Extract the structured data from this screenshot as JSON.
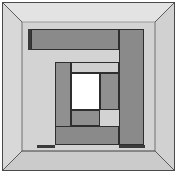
{
  "figure": {
    "type": "line-drawing",
    "canvas": {
      "width": 179,
      "height": 175
    },
    "palette": {
      "page_background": "#ffffff",
      "frame_outline": "#4a4a4a",
      "wall_light": "#dcdcdc",
      "wall_back": "#d2d2d2",
      "ceiling": "#e2e2e2",
      "floor": "#cccccc",
      "side_wall_left": "#d6d6d6",
      "side_wall_right": "#d0d0d0",
      "block_dark": "#8a8a8a",
      "block_mid": "#909090",
      "block_light": "#cfcfcf",
      "block_white": "#ffffff",
      "block_outline": "#2e2e2e",
      "shadow": "#3a3a3a"
    },
    "outer_frame": {
      "x": 2,
      "y": 2,
      "width": 173,
      "height": 169
    },
    "vanishing_box": {
      "outer": {
        "x": 3,
        "y": 3,
        "width": 171,
        "height": 167
      },
      "inner": {
        "x": 22,
        "y": 22,
        "width": 133,
        "height": 129
      },
      "diagonals": [
        {
          "name": "top-left-diagonal",
          "x1": 3,
          "y1": 3,
          "x2": 22,
          "y2": 22
        },
        {
          "name": "top-right-diagonal",
          "x1": 174,
          "y1": 3,
          "x2": 155,
          "y2": 22
        },
        {
          "name": "bottom-left-diagonal",
          "x1": 3,
          "y1": 170,
          "x2": 22,
          "y2": 151
        },
        {
          "name": "bottom-right-diagonal",
          "x1": 174,
          "y1": 170,
          "x2": 155,
          "y2": 151
        }
      ]
    },
    "blocks": [
      {
        "name": "top-bar",
        "x": 31,
        "y": 29,
        "width": 88,
        "height": 21,
        "shade": "dark",
        "label": "top horizontal bar"
      },
      {
        "name": "right-column",
        "x": 119,
        "y": 29,
        "width": 25,
        "height": 116,
        "shade": "dark",
        "label": "right vertical column"
      },
      {
        "name": "inner-left-column",
        "x": 55,
        "y": 62,
        "width": 16,
        "height": 83,
        "shade": "mid",
        "label": "inner left column"
      },
      {
        "name": "inner-top-band",
        "x": 71,
        "y": 62,
        "width": 48,
        "height": 11,
        "shade": "light",
        "label": "inner light band above center"
      },
      {
        "name": "center-white",
        "x": 71,
        "y": 73,
        "width": 29,
        "height": 37,
        "shade": "white",
        "label": "central white opening"
      },
      {
        "name": "inner-right-block",
        "x": 100,
        "y": 73,
        "width": 19,
        "height": 37,
        "shade": "mid",
        "label": "inner right block"
      },
      {
        "name": "inner-bottom-block",
        "x": 71,
        "y": 110,
        "width": 29,
        "height": 16,
        "shade": "mid",
        "label": "inner bottom block"
      },
      {
        "name": "bottom-bar",
        "x": 55,
        "y": 126,
        "width": 64,
        "height": 19,
        "shade": "dark",
        "label": "bottom horizontal bar"
      }
    ],
    "shadows": [
      {
        "name": "top-left-shadow-sliver",
        "x": 28,
        "y": 29,
        "width": 3,
        "height": 21
      },
      {
        "name": "bottom-left-shadow-sliver",
        "x": 37,
        "y": 145,
        "width": 18,
        "height": 3
      },
      {
        "name": "bottom-right-shadow-sliver",
        "x": 119,
        "y": 145,
        "width": 26,
        "height": 3
      }
    ]
  }
}
